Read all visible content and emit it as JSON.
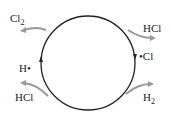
{
  "diagram": {
    "type": "catalytic-cycle",
    "labels": {
      "cl2": "Cl",
      "cl2_sub": "2",
      "hcl_top": "HCl",
      "cl_radical": "•Cl",
      "h_radical": "H•",
      "hcl_bottom": "HCl",
      "h2": "H",
      "h2_sub": "2"
    },
    "colors": {
      "cycle": "#222222",
      "arrows": "#999999"
    }
  }
}
